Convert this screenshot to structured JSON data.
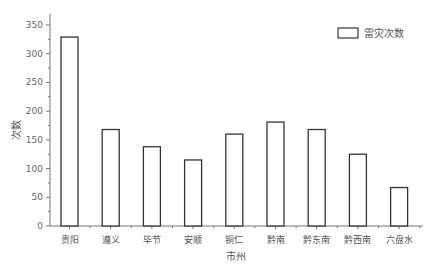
{
  "chart_data": {
    "type": "bar",
    "title": "",
    "xlabel": "市州",
    "ylabel": "次数",
    "categories": [
      "贵阳",
      "遵义",
      "毕节",
      "安顺",
      "铜仁",
      "黔南",
      "黔东南",
      "黔西南",
      "六盘水"
    ],
    "series": [
      {
        "name": "雷灾次数",
        "values": [
          329,
          168,
          138,
          115,
          160,
          181,
          168,
          125,
          67
        ]
      }
    ],
    "ylim": [
      0,
      370
    ],
    "yticks": [
      0,
      50,
      100,
      150,
      200,
      250,
      300,
      350
    ],
    "grid": false,
    "legend_position": "top-right",
    "bar_fill": "#ffffff",
    "bar_stroke": "#333333"
  }
}
